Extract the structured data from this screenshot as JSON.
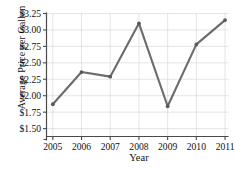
{
  "chart_data": {
    "type": "line",
    "title": "",
    "xlabel": "Year",
    "ylabel": "Average Price per Gallon",
    "categories": [
      "2005",
      "2006",
      "2007",
      "2008",
      "2009",
      "2010",
      "2011"
    ],
    "x": [
      2005,
      2006,
      2007,
      2008,
      2009,
      2010,
      2011
    ],
    "values": [
      1.87,
      2.36,
      2.29,
      3.1,
      1.84,
      2.78,
      3.15
    ],
    "series": [
      {
        "name": "Average Price per Gallon",
        "values": [
          1.87,
          2.36,
          2.29,
          3.1,
          1.84,
          2.78,
          3.15
        ]
      }
    ],
    "ylim": [
      1.38,
      3.25
    ],
    "xlim": [
      2004.78,
      2011.12
    ],
    "ytick_values": [
      1.5,
      1.75,
      2.0,
      2.25,
      2.5,
      2.75,
      3.0,
      3.25
    ],
    "ytick_labels": [
      "$1.50",
      "$1.75",
      "$2.00",
      "$2.25",
      "$2.50",
      "$2.75",
      "$3.00",
      "$3.25"
    ],
    "xtick_labels": [
      "2005",
      "2006",
      "2007",
      "2008",
      "2009",
      "2010",
      "2011"
    ],
    "grid": true,
    "grid_axis": "both",
    "legend": "none",
    "marker": "circle",
    "colors": {
      "line": "#6b6b6b",
      "marker": "#5a5a5a",
      "grid": "#d9d9d9",
      "axis": "#4a4a4a",
      "text": "#111111",
      "background": "#ffffff"
    }
  }
}
